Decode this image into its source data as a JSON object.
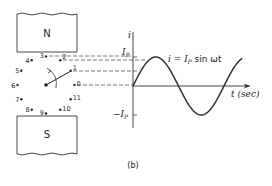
{
  "figure_label": "(b)",
  "magnets": {
    "north_label": "N",
    "south_label": "S"
  },
  "rotor": {
    "positions": [
      "0",
      "1",
      "2",
      "3",
      "4",
      "5",
      "6",
      "7",
      "8",
      "9",
      "10",
      "11"
    ],
    "conductor_at_position": "1"
  },
  "graph": {
    "y_axis_label": "i",
    "x_axis_label": "t (sec)",
    "peak_label": "I",
    "peak_sub": "P",
    "neg_peak_label": "−I",
    "neg_peak_sub": "P",
    "equation": {
      "lhs": "i = I",
      "sub": "P",
      "rhs": " sin ωt"
    }
  },
  "chart_data": {
    "type": "line",
    "xlabel": "t (sec)",
    "ylabel": "i",
    "y_ticks": [
      "I_P",
      "−I_P"
    ],
    "x_cycles": 1.2,
    "amplitude": 1,
    "series": [
      {
        "name": "i",
        "function": "sin",
        "phase_start": 0,
        "phase_end_cycles": 1.2
      }
    ]
  },
  "colors": {
    "ink": "#222222",
    "background": "#ffffff"
  }
}
